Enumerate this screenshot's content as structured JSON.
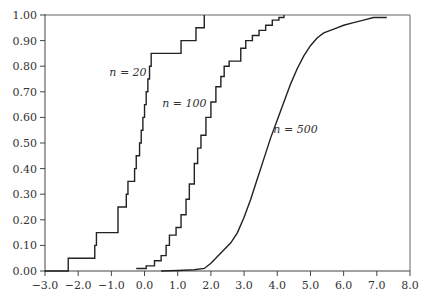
{
  "chart_data": {
    "type": "line",
    "title": "",
    "xlabel": "",
    "ylabel": "",
    "xlim": [
      -3.0,
      8.0
    ],
    "ylim": [
      0.0,
      1.0
    ],
    "grid": false,
    "legend": "inline labels",
    "x_ticks": [
      "−3.0",
      "−2.0",
      "−1.0",
      "0.0",
      "1.0",
      "2.0",
      "3.0",
      "4.0",
      "5.0",
      "6.0",
      "7.0",
      "8.0"
    ],
    "x_tick_values": [
      -3,
      -2,
      -1,
      0,
      1,
      2,
      3,
      4,
      5,
      6,
      7,
      8
    ],
    "y_ticks": [
      "0.00",
      "0.10",
      "0.20",
      "0.30",
      "0.40",
      "0.50",
      "0.60",
      "0.70",
      "0.80",
      "0.90",
      "1.00"
    ],
    "y_tick_values": [
      0,
      0.1,
      0.2,
      0.3,
      0.4,
      0.5,
      0.6,
      0.7,
      0.8,
      0.9,
      1.0
    ],
    "series": [
      {
        "name": "n = 20",
        "label_pos": [
          -0.5,
          0.76
        ],
        "step": true,
        "x": [
          -3.0,
          -2.3,
          -1.5,
          -1.45,
          -0.8,
          -0.55,
          -0.5,
          -0.3,
          -0.25,
          -0.15,
          -0.1,
          -0.05,
          0.0,
          0.05,
          0.1,
          0.15,
          0.2,
          0.35,
          1.1,
          1.55,
          1.8
        ],
        "y": [
          0.0,
          0.05,
          0.1,
          0.15,
          0.25,
          0.3,
          0.35,
          0.4,
          0.45,
          0.5,
          0.55,
          0.6,
          0.65,
          0.7,
          0.75,
          0.8,
          0.85,
          0.85,
          0.9,
          0.95,
          1.0
        ]
      },
      {
        "name": "n = 100",
        "label_pos": [
          1.2,
          0.64
        ],
        "step": true,
        "x": [
          -0.25,
          0.05,
          0.3,
          0.5,
          0.65,
          0.75,
          0.95,
          1.1,
          1.25,
          1.35,
          1.5,
          1.6,
          1.7,
          1.85,
          2.0,
          2.15,
          2.3,
          2.4,
          2.55,
          2.75,
          2.9,
          3.05,
          3.25,
          3.45,
          3.65,
          3.85,
          4.05,
          4.2
        ],
        "y": [
          0.01,
          0.02,
          0.04,
          0.06,
          0.1,
          0.14,
          0.17,
          0.22,
          0.28,
          0.34,
          0.42,
          0.48,
          0.53,
          0.6,
          0.66,
          0.72,
          0.76,
          0.8,
          0.82,
          0.82,
          0.87,
          0.9,
          0.92,
          0.94,
          0.96,
          0.98,
          0.99,
          1.0
        ]
      },
      {
        "name": "n = 500",
        "label_pos": [
          4.55,
          0.54
        ],
        "step": false,
        "x": [
          0.5,
          1.0,
          1.5,
          1.8,
          2.0,
          2.3,
          2.6,
          2.8,
          3.0,
          3.2,
          3.4,
          3.6,
          3.8,
          4.0,
          4.2,
          4.4,
          4.6,
          4.8,
          5.0,
          5.2,
          5.4,
          5.6,
          5.8,
          6.0,
          6.3,
          6.6,
          6.9,
          7.3
        ],
        "y": [
          0.0,
          0.002,
          0.005,
          0.01,
          0.03,
          0.07,
          0.11,
          0.15,
          0.21,
          0.28,
          0.36,
          0.44,
          0.52,
          0.59,
          0.66,
          0.73,
          0.79,
          0.84,
          0.88,
          0.91,
          0.93,
          0.94,
          0.95,
          0.96,
          0.97,
          0.98,
          0.99,
          0.99
        ]
      }
    ]
  },
  "colors": {
    "line": "#222222",
    "axis": "#444444",
    "frame": "#666666",
    "background": "#ffffff"
  }
}
